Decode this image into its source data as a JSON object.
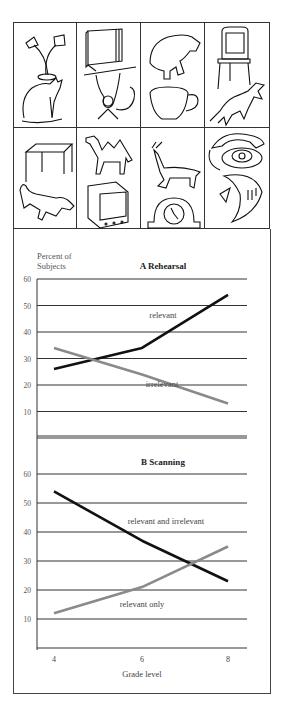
{
  "picture_grid": {
    "rows": 2,
    "cols": 4,
    "cells": [
      {
        "label": "lamp and cat",
        "icons": [
          "lamp-icon",
          "cat-icon"
        ]
      },
      {
        "label": "book and monkey",
        "icons": [
          "book-icon",
          "monkey-icon"
        ]
      },
      {
        "label": "bear and cup",
        "icons": [
          "bear-icon",
          "cup-icon"
        ]
      },
      {
        "label": "chair and horse",
        "icons": [
          "chair-icon",
          "horse-icon"
        ]
      },
      {
        "label": "table and dog",
        "icons": [
          "table-icon",
          "dog-icon"
        ]
      },
      {
        "label": "camel and television",
        "icons": [
          "camel-icon",
          "television-icon"
        ]
      },
      {
        "label": "deer and clock",
        "icons": [
          "deer-icon",
          "clock-icon"
        ]
      },
      {
        "label": "telephone and fish",
        "icons": [
          "telephone-icon",
          "fish-icon"
        ]
      }
    ]
  },
  "y_axis_title_line1": "Percent of",
  "y_axis_title_line2": "Subjects",
  "x_axis_title": "Grade level",
  "colors": {
    "dark_line": "#111111",
    "gray_line": "#8a8a8a",
    "grid": "#333333"
  },
  "chart_data": [
    {
      "type": "line",
      "title": "A Rehearsal",
      "xlabel": "Grade level",
      "ylabel": "Percent of Subjects",
      "x": [
        4,
        6,
        8
      ],
      "yticks": [
        10,
        20,
        30,
        40,
        50,
        60
      ],
      "ylim": [
        0,
        60
      ],
      "grid": true,
      "series": [
        {
          "name": "relevant",
          "color": "#111111",
          "values": [
            26,
            34,
            54
          ]
        },
        {
          "name": "irrelevant",
          "color": "#8a8a8a",
          "values": [
            34,
            24,
            13
          ]
        }
      ]
    },
    {
      "type": "line",
      "title": "B Scanning",
      "xlabel": "Grade level",
      "ylabel": "Percent of Subjects",
      "x": [
        4,
        6,
        8
      ],
      "xticks": [
        "4",
        "6",
        "8"
      ],
      "yticks": [
        10,
        20,
        30,
        40,
        50,
        60
      ],
      "ylim": [
        0,
        60
      ],
      "grid": true,
      "series": [
        {
          "name": "relevant and irrelevant",
          "color": "#111111",
          "values": [
            54,
            37,
            23
          ]
        },
        {
          "name": "relevant only",
          "color": "#8a8a8a",
          "values": [
            12,
            21,
            35
          ]
        }
      ]
    }
  ]
}
